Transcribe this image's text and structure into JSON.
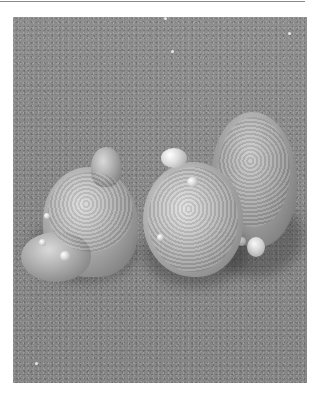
{
  "figure": {
    "type": "scanning-electron-micrograph",
    "colors": {
      "background": "#ffffff",
      "substrate": "#888888",
      "rule_line": "#8a8a8a",
      "cell_highlight": "#d9d9d9",
      "cell_shadow": "#6e6e6e",
      "bleb": "#dcdcdc"
    },
    "cells": [
      {
        "id": "left-cell",
        "label": ""
      },
      {
        "id": "center-cell",
        "label": ""
      },
      {
        "id": "right-cell",
        "label": ""
      }
    ]
  }
}
